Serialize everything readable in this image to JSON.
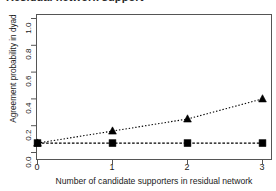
{
  "figure": {
    "title_clipped": "Residual network support",
    "background": "#ffffff"
  },
  "chart_data": {
    "type": "line",
    "title": "Residual network support",
    "xlabel": "Number of candidate supporters in residual network",
    "ylabel": "Agreement probability in dyad",
    "x": [
      0,
      1,
      2,
      3
    ],
    "xticklabels": [
      "0",
      "1",
      "2",
      "3"
    ],
    "yticklabels": [
      "0.0",
      "0.2",
      "0.4",
      "0.6",
      "0.8",
      "1.0"
    ],
    "yticks": [
      0.0,
      0.2,
      0.4,
      0.6,
      0.8,
      1.0
    ],
    "xlim": [
      -0.18,
      3.18
    ],
    "ylim": [
      0.0,
      1.0
    ],
    "grid": false,
    "legend": "none",
    "series": [
      {
        "name": "dotted-triangle-series",
        "marker": "triangle",
        "linestyle": "dotted",
        "color": "#000000",
        "values": [
          0.07,
          0.16,
          0.25,
          0.4
        ]
      },
      {
        "name": "dashed-square-series",
        "marker": "square",
        "linestyle": "dashed",
        "color": "#000000",
        "values": [
          0.07,
          0.07,
          0.07,
          0.07
        ]
      }
    ]
  }
}
